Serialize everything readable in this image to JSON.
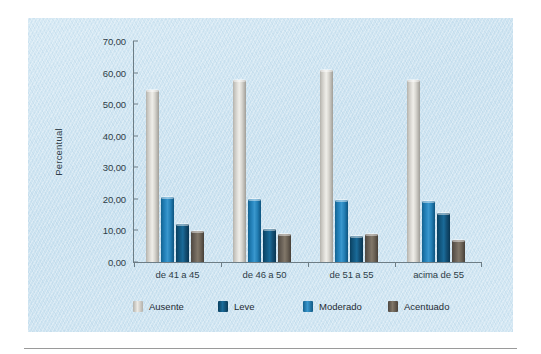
{
  "chart_data": {
    "type": "bar",
    "title": "",
    "xlabel": "",
    "ylabel": "Percentual",
    "ylim": [
      0,
      70
    ],
    "ytick_step": 10,
    "grid": false,
    "legend_position": "bottom",
    "categories": [
      "de 41 a 45",
      "de 46 a 50",
      "de 51 a 55",
      "acima de 55"
    ],
    "ytick_labels": [
      "70,00",
      "60,00",
      "50,00",
      "40,00",
      "30,00",
      "20,00",
      "10,00",
      "0,00"
    ],
    "ytick_values": [
      70,
      60,
      50,
      40,
      30,
      20,
      10,
      0
    ],
    "series": [
      {
        "name": "Ausente",
        "color": "#d8d6d0",
        "values": [
          54.5,
          57.8,
          60.8,
          57.8
        ]
      },
      {
        "name": "Leve",
        "color": "#16618c",
        "values": [
          12.0,
          10.5,
          8.2,
          15.5
        ]
      },
      {
        "name": "Moderado",
        "color": "#2c8bc4",
        "values": [
          20.6,
          20.0,
          19.5,
          19.3
        ]
      },
      {
        "name": "Acentuado",
        "color": "#756c61",
        "values": [
          9.8,
          9.0,
          9.0,
          7.0
        ]
      }
    ],
    "bar_draw_order": [
      "Ausente",
      "Moderado",
      "Leve",
      "Acentuado"
    ]
  },
  "legend": {
    "items": [
      {
        "label": "Ausente",
        "swatch": "c-ausente"
      },
      {
        "label": "Leve",
        "swatch": "c-leve"
      },
      {
        "label": "Moderado",
        "swatch": "c-moderado"
      },
      {
        "label": "Acentuado",
        "swatch": "c-acentuado"
      }
    ]
  },
  "colors": {
    "panel_background": "#cfe4f0",
    "axis": "#6d7d85",
    "text": "#2e3d47",
    "rule": "#9a9a9a"
  }
}
